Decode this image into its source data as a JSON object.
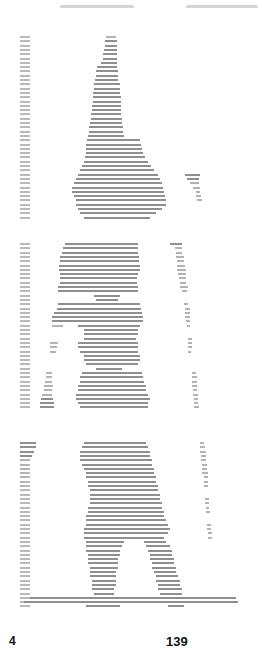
{
  "page": {
    "type": "scanned-printout",
    "header_note": "illegible handwritten annotation (bleed-through)",
    "footer": {
      "left_label": "4",
      "page_number": "139"
    }
  },
  "plots": [
    {
      "name": "plot-1",
      "top": 36,
      "row_height": 4.3,
      "row_count": 43,
      "rows": [
        [
          [
            106,
            116
          ]
        ],
        [
          [
            105,
            117
          ]
        ],
        [
          [
            105,
            117
          ]
        ],
        [
          [
            104,
            117
          ]
        ],
        [
          [
            103,
            117
          ]
        ],
        [
          [
            103,
            117
          ]
        ],
        [
          [
            101,
            117
          ]
        ],
        [
          [
            97,
            117
          ]
        ],
        [
          [
            96,
            118
          ]
        ],
        [
          [
            96,
            118
          ]
        ],
        [
          [
            95,
            118
          ]
        ],
        [
          [
            94,
            120
          ]
        ],
        [
          [
            94,
            120
          ]
        ],
        [
          [
            93,
            120
          ]
        ],
        [
          [
            93,
            121
          ]
        ],
        [
          [
            93,
            121
          ]
        ],
        [
          [
            92,
            121
          ]
        ],
        [
          [
            92,
            121
          ]
        ],
        [
          [
            91,
            121
          ]
        ],
        [
          [
            91,
            122
          ]
        ],
        [
          [
            90,
            122
          ]
        ],
        [
          [
            89,
            123
          ]
        ],
        [
          [
            89,
            123
          ]
        ],
        [
          [
            88,
            124
          ]
        ],
        [
          [
            87,
            140
          ]
        ],
        [
          [
            86,
            141
          ]
        ],
        [
          [
            86,
            142
          ]
        ],
        [
          [
            86,
            143
          ]
        ],
        [
          [
            85,
            145
          ]
        ],
        [
          [
            84,
            148
          ]
        ],
        [
          [
            82,
            151
          ]
        ],
        [
          [
            80,
            154
          ]
        ],
        [
          [
            78,
            158
          ],
          [
            185,
            200
          ]
        ],
        [
          [
            76,
            160
          ],
          [
            187,
            199
          ]
        ],
        [
          [
            74,
            162
          ],
          [
            190,
            199
          ]
        ],
        [
          [
            72,
            163
          ],
          [
            193,
            200
          ]
        ],
        [
          [
            72,
            164
          ],
          [
            196,
            200
          ]
        ],
        [
          [
            74,
            165
          ],
          [
            196,
            201
          ]
        ],
        [
          [
            76,
            166
          ],
          [
            197,
            202
          ]
        ],
        [
          [
            76,
            166
          ]
        ],
        [
          [
            78,
            162
          ]
        ],
        [
          [
            80,
            156
          ]
        ],
        [
          [
            84,
            150
          ]
        ]
      ]
    },
    {
      "name": "plot-2",
      "top": 243,
      "row_height": 4.3,
      "row_count": 39,
      "rows": [
        [
          [
            65,
            138
          ],
          [
            170,
            182
          ]
        ],
        [
          [
            63,
            138
          ],
          [
            175,
            182
          ]
        ],
        [
          [
            62,
            138
          ],
          [
            176,
            182
          ]
        ],
        [
          [
            60,
            139
          ],
          [
            176,
            184
          ]
        ],
        [
          [
            60,
            139
          ],
          [
            177,
            184
          ]
        ],
        [
          [
            59,
            140
          ],
          [
            177,
            185
          ]
        ],
        [
          [
            59,
            140
          ],
          [
            177,
            186
          ]
        ],
        [
          [
            60,
            138
          ],
          [
            178,
            186
          ]
        ],
        [
          [
            60,
            137
          ],
          [
            179,
            186
          ]
        ],
        [
          [
            60,
            137
          ],
          [
            180,
            186
          ]
        ],
        [
          [
            58,
            138
          ],
          [
            180,
            188
          ]
        ],
        [
          [
            58,
            138
          ],
          [
            182,
            187
          ]
        ],
        [
          [
            94,
            120
          ]
        ],
        [
          [
            96,
            118
          ]
        ],
        [
          [
            58,
            140
          ],
          [
            184,
            188
          ]
        ],
        [
          [
            57,
            141
          ],
          [
            185,
            190
          ]
        ],
        [
          [
            54,
            142
          ],
          [
            185,
            190
          ]
        ],
        [
          [
            52,
            143
          ],
          [
            185,
            190
          ]
        ],
        [
          [
            52,
            143
          ],
          [
            186,
            190
          ]
        ],
        [
          [
            52,
            63
          ],
          [
            78,
            140
          ],
          [
            187,
            190
          ]
        ],
        [
          [
            84,
            138
          ]
        ],
        [
          [
            84,
            138
          ]
        ],
        [
          [
            84,
            136
          ],
          [
            188,
            192
          ]
        ],
        [
          [
            50,
            58
          ],
          [
            78,
            138
          ],
          [
            188,
            192
          ]
        ],
        [
          [
            50,
            57
          ],
          [
            78,
            138
          ],
          [
            188,
            192
          ]
        ],
        [
          [
            50,
            56
          ],
          [
            80,
            138
          ],
          [
            188,
            191
          ]
        ],
        [
          [
            84,
            140
          ]
        ],
        [
          [
            84,
            140
          ]
        ],
        [
          [
            86,
            138
          ]
        ],
        [
          [
            96,
            122
          ]
        ],
        [
          [
            46,
            52
          ],
          [
            82,
            142
          ],
          [
            192,
            196
          ]
        ],
        [
          [
            46,
            52
          ],
          [
            80,
            143
          ],
          [
            192,
            197
          ]
        ],
        [
          [
            45,
            52
          ],
          [
            80,
            144
          ],
          [
            192,
            197
          ]
        ],
        [
          [
            44,
            53
          ],
          [
            78,
            146
          ],
          [
            192,
            197
          ]
        ],
        [
          [
            44,
            52
          ],
          [
            78,
            146
          ],
          [
            193,
            197
          ]
        ],
        [
          [
            42,
            52
          ],
          [
            76,
            148
          ],
          [
            193,
            198
          ]
        ],
        [
          [
            41,
            53
          ],
          [
            76,
            150
          ],
          [
            194,
            198
          ]
        ],
        [
          [
            40,
            54
          ],
          [
            78,
            148
          ],
          [
            194,
            198
          ]
        ],
        [
          [
            40,
            54
          ],
          [
            80,
            148
          ],
          [
            194,
            199
          ]
        ]
      ]
    },
    {
      "name": "plot-3",
      "top": 442,
      "row_height": 4.3,
      "row_count": 39,
      "rows": [
        [
          [
            20,
            36
          ],
          [
            84,
            146
          ],
          [
            200,
            204
          ]
        ],
        [
          [
            20,
            36
          ],
          [
            82,
            148
          ],
          [
            200,
            205
          ]
        ],
        [
          [
            20,
            34
          ],
          [
            80,
            150
          ],
          [
            200,
            206
          ]
        ],
        [
          [
            20,
            32
          ],
          [
            80,
            150
          ],
          [
            201,
            206
          ]
        ],
        [
          [
            20,
            30
          ],
          [
            80,
            152
          ],
          [
            201,
            206
          ]
        ],
        [
          [
            20,
            28
          ],
          [
            82,
            152
          ],
          [
            202,
            207
          ]
        ],
        [
          [
            20,
            27
          ],
          [
            84,
            154
          ],
          [
            202,
            207
          ]
        ],
        [
          [
            20,
            26
          ],
          [
            86,
            154
          ],
          [
            202,
            208
          ]
        ],
        [
          [
            20,
            26
          ],
          [
            86,
            156
          ],
          [
            204,
            208
          ]
        ],
        [
          [
            20,
            25
          ],
          [
            88,
            156
          ],
          [
            204,
            208
          ]
        ],
        [
          [
            20,
            24
          ],
          [
            88,
            158
          ],
          [
            204,
            208
          ]
        ],
        [
          [
            90,
            158
          ]
        ],
        [
          [
            90,
            160
          ]
        ],
        [
          [
            90,
            160
          ],
          [
            205,
            209
          ]
        ],
        [
          [
            90,
            162
          ],
          [
            205,
            209
          ]
        ],
        [
          [
            88,
            162
          ],
          [
            206,
            209
          ]
        ],
        [
          [
            88,
            164
          ],
          [
            206,
            210
          ]
        ],
        [
          [
            86,
            164
          ]
        ],
        [
          [
            86,
            166
          ]
        ],
        [
          [
            86,
            168
          ],
          [
            207,
            211
          ]
        ],
        [
          [
            84,
            170
          ],
          [
            207,
            211
          ]
        ],
        [
          [
            84,
            168
          ],
          [
            208,
            212
          ]
        ],
        [
          [
            84,
            164
          ],
          [
            208,
            212
          ]
        ],
        [
          [
            86,
            124
          ],
          [
            144,
            166
          ]
        ],
        [
          [
            86,
            122
          ],
          [
            146,
            170
          ]
        ],
        [
          [
            86,
            120
          ],
          [
            148,
            172
          ]
        ],
        [
          [
            88,
            120
          ],
          [
            150,
            172
          ]
        ],
        [
          [
            88,
            118
          ],
          [
            150,
            174
          ]
        ],
        [
          [
            88,
            118
          ],
          [
            152,
            174
          ]
        ],
        [
          [
            90,
            118
          ],
          [
            152,
            176
          ]
        ],
        [
          [
            90,
            116
          ],
          [
            154,
            176
          ]
        ],
        [
          [
            90,
            116
          ],
          [
            156,
            178
          ]
        ],
        [
          [
            92,
            116
          ],
          [
            156,
            180
          ]
        ],
        [
          [
            92,
            116
          ],
          [
            158,
            180
          ]
        ],
        [
          [
            92,
            114
          ],
          [
            158,
            182
          ]
        ],
        [
          [
            94,
            114
          ],
          [
            160,
            182
          ]
        ],
        [
          [
            30,
            236
          ]
        ],
        [
          [
            24,
            238
          ]
        ],
        [
          [
            86,
            120
          ],
          [
            168,
            184
          ]
        ]
      ]
    }
  ]
}
